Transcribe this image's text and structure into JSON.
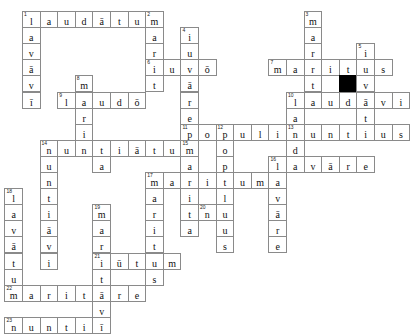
{
  "puzzle": {
    "title": "Latin Vocabulary Crossword",
    "kind": "crossword-grid",
    "cols": 23,
    "rows": 19,
    "cell_w": 17.6,
    "cell_h": 16.1,
    "origin_x": 22,
    "origin_y": 11,
    "colors": {
      "grid_line": "#8a8a8a",
      "block": "#000000",
      "letter": "#111111",
      "number": "#222222",
      "background": "#ffffff"
    },
    "entries": [
      {
        "number": 1,
        "direction": "across",
        "answer": "laudātum",
        "row": 0,
        "col": 0
      },
      {
        "number": 1,
        "direction": "down",
        "answer": "laudāvī",
        "row": 0,
        "col": 0
      },
      {
        "number": 2,
        "direction": "down",
        "answer": "maritiuvō",
        "row": 0,
        "col": 7
      },
      {
        "number": 3,
        "direction": "down",
        "answer": "maritum",
        "row": 0,
        "col": 16
      },
      {
        "number": 4,
        "direction": "down",
        "answer": "iuvāre",
        "row": 1,
        "col": 9
      },
      {
        "number": 5,
        "direction": "down",
        "answer": "iuvi",
        "row": 2,
        "col": 19
      },
      {
        "number": 6,
        "direction": "across",
        "answer": "iuvō",
        "row": 3,
        "col": 7
      },
      {
        "number": 7,
        "direction": "across",
        "answer": "maritus",
        "row": 3,
        "col": 14
      },
      {
        "number": 8,
        "direction": "down",
        "answer": "marin",
        "row": 4,
        "col": 3
      },
      {
        "number": 9,
        "direction": "across",
        "answer": "laudō",
        "row": 5,
        "col": 2
      },
      {
        "number": 10,
        "direction": "across",
        "answer": "laudāvi",
        "row": 5,
        "col": 15
      },
      {
        "number": 10,
        "direction": "down",
        "answer": "laudm",
        "row": 5,
        "col": 15
      },
      {
        "number": 11,
        "direction": "across",
        "answer": "populi",
        "row": 7,
        "col": 9
      },
      {
        "number": 12,
        "direction": "down",
        "answer": "populus",
        "row": 7,
        "col": 11
      },
      {
        "number": 13,
        "direction": "across",
        "answer": "nuntius",
        "row": 7,
        "col": 14
      },
      {
        "number": 14,
        "direction": "across",
        "answer": "nuntiātum",
        "row": 8,
        "col": 1
      },
      {
        "number": 14,
        "direction": "down",
        "answer": "nuntiāvi",
        "row": 8,
        "col": 1
      },
      {
        "number": 15,
        "direction": "down",
        "answer": "marita",
        "row": 8,
        "col": 9
      },
      {
        "number": 16,
        "direction": "across",
        "answer": "lavāre",
        "row": 9,
        "col": 14
      },
      {
        "number": 16,
        "direction": "down",
        "answer": "lav",
        "row": 9,
        "col": 14
      },
      {
        "number": 17,
        "direction": "across",
        "answer": "maritum",
        "row": 10,
        "col": 7
      },
      {
        "number": 17,
        "direction": "down",
        "answer": "marit",
        "row": 10,
        "col": 7
      },
      {
        "number": 18,
        "direction": "down",
        "answer": "lavātum",
        "row": 10,
        "col": -1
      },
      {
        "number": 19,
        "direction": "down",
        "answer": "maritvi",
        "row": 11,
        "col": 4
      },
      {
        "number": 20,
        "direction": "across",
        "answer": "nuntiō",
        "row": 12,
        "col": 10
      },
      {
        "number": 21,
        "direction": "across",
        "answer": "iūtum",
        "row": 13,
        "col": 4
      },
      {
        "number": 22,
        "direction": "across",
        "answer": "maritāre",
        "row": 16,
        "col": -1
      },
      {
        "number": 23,
        "direction": "across",
        "answer": "nuntiī",
        "row": 18,
        "col": -1
      }
    ],
    "cells": [
      {
        "c": 0,
        "r": 0,
        "l": "l",
        "n": "1"
      },
      {
        "c": 1,
        "r": 0,
        "l": "a"
      },
      {
        "c": 2,
        "r": 0,
        "l": "u"
      },
      {
        "c": 3,
        "r": 0,
        "l": "d"
      },
      {
        "c": 4,
        "r": 0,
        "l": "ā"
      },
      {
        "c": 5,
        "r": 0,
        "l": "t"
      },
      {
        "c": 6,
        "r": 0,
        "l": "u"
      },
      {
        "c": 7,
        "r": 0,
        "l": "m",
        "n": "2"
      },
      {
        "c": 16,
        "r": 0,
        "l": "m",
        "n": "3"
      },
      {
        "c": 0,
        "r": 1,
        "l": "a"
      },
      {
        "c": 7,
        "r": 1,
        "l": "a"
      },
      {
        "c": 9,
        "r": 1,
        "l": "i",
        "n": "4"
      },
      {
        "c": 16,
        "r": 1,
        "l": "a"
      },
      {
        "c": 0,
        "r": 2,
        "l": "v"
      },
      {
        "c": 7,
        "r": 2,
        "l": "r"
      },
      {
        "c": 9,
        "r": 2,
        "l": "u"
      },
      {
        "c": 16,
        "r": 2,
        "l": "r"
      },
      {
        "c": 19,
        "r": 2,
        "l": "i",
        "n": "5"
      },
      {
        "c": 0,
        "r": 3,
        "l": "ā"
      },
      {
        "c": 7,
        "r": 3,
        "l": "i",
        "n": "6"
      },
      {
        "c": 8,
        "r": 3,
        "l": "u"
      },
      {
        "c": 9,
        "r": 3,
        "l": "v"
      },
      {
        "c": 10,
        "r": 3,
        "l": "ō"
      },
      {
        "c": 14,
        "r": 3,
        "l": "m",
        "n": "7"
      },
      {
        "c": 15,
        "r": 3,
        "l": "a"
      },
      {
        "c": 16,
        "r": 3,
        "l": "r"
      },
      {
        "c": 17,
        "r": 3,
        "l": "i"
      },
      {
        "c": 18,
        "r": 3,
        "l": "t"
      },
      {
        "c": 19,
        "r": 3,
        "l": "u"
      },
      {
        "c": 20,
        "r": 3,
        "l": "s"
      },
      {
        "c": 0,
        "r": 4,
        "l": "v"
      },
      {
        "c": 3,
        "r": 4,
        "l": "m",
        "n": "8"
      },
      {
        "c": 7,
        "r": 4,
        "l": "t"
      },
      {
        "c": 9,
        "r": 4,
        "l": "ā"
      },
      {
        "c": 16,
        "r": 4,
        "l": "t"
      },
      {
        "c": 18,
        "r": 4,
        "l": "",
        "block": true
      },
      {
        "c": 19,
        "r": 4,
        "l": "v"
      },
      {
        "c": 0,
        "r": 5,
        "l": "ī"
      },
      {
        "c": 2,
        "r": 5,
        "l": "l",
        "n": "9"
      },
      {
        "c": 3,
        "r": 5,
        "l": "a"
      },
      {
        "c": 4,
        "r": 5,
        "l": "u"
      },
      {
        "c": 5,
        "r": 5,
        "l": "d"
      },
      {
        "c": 6,
        "r": 5,
        "l": "ō"
      },
      {
        "c": 9,
        "r": 5,
        "l": "r"
      },
      {
        "c": 15,
        "r": 5,
        "l": "l",
        "n": "10"
      },
      {
        "c": 16,
        "r": 5,
        "l": "a"
      },
      {
        "c": 17,
        "r": 5,
        "l": "u"
      },
      {
        "c": 18,
        "r": 5,
        "l": "d"
      },
      {
        "c": 19,
        "r": 5,
        "l": "ā"
      },
      {
        "c": 20,
        "r": 5,
        "l": "v"
      },
      {
        "c": 21,
        "r": 5,
        "l": "i"
      },
      {
        "c": 3,
        "r": 6,
        "l": "r"
      },
      {
        "c": 9,
        "r": 6,
        "l": "e"
      },
      {
        "c": 15,
        "r": 6,
        "l": "a"
      },
      {
        "c": 19,
        "r": 6,
        "l": "t"
      },
      {
        "c": 3,
        "r": 7,
        "l": "i"
      },
      {
        "c": 9,
        "r": 7,
        "l": "p",
        "n": "11"
      },
      {
        "c": 10,
        "r": 7,
        "l": "o"
      },
      {
        "c": 11,
        "r": 7,
        "l": "p",
        "n": "12"
      },
      {
        "c": 12,
        "r": 7,
        "l": "u"
      },
      {
        "c": 13,
        "r": 7,
        "l": "l"
      },
      {
        "c": 14,
        "r": 7,
        "l": "i"
      },
      {
        "c": 15,
        "r": 7,
        "l": "n",
        "n": "13"
      },
      {
        "c": 16,
        "r": 7,
        "l": "u"
      },
      {
        "c": 17,
        "r": 7,
        "l": "n"
      },
      {
        "c": 18,
        "r": 7,
        "l": "t"
      },
      {
        "c": 19,
        "r": 7,
        "l": "i"
      },
      {
        "c": 20,
        "r": 7,
        "l": "u"
      },
      {
        "c": 21,
        "r": 7,
        "l": "s"
      },
      {
        "c": 1,
        "r": 8,
        "l": "n",
        "n": "14"
      },
      {
        "c": 2,
        "r": 8,
        "l": "u"
      },
      {
        "c": 3,
        "r": 8,
        "l": "n"
      },
      {
        "c": 4,
        "r": 8,
        "l": "t"
      },
      {
        "c": 5,
        "r": 8,
        "l": "i"
      },
      {
        "c": 6,
        "r": 8,
        "l": "ā"
      },
      {
        "c": 7,
        "r": 8,
        "l": "t"
      },
      {
        "c": 8,
        "r": 8,
        "l": "u"
      },
      {
        "c": 9,
        "r": 8,
        "l": "m",
        "n": "15"
      },
      {
        "c": 11,
        "r": 8,
        "l": "o"
      },
      {
        "c": 15,
        "r": 8,
        "l": "d"
      },
      {
        "c": 1,
        "r": 9,
        "l": "u"
      },
      {
        "c": 4,
        "r": 9,
        "l": "a"
      },
      {
        "c": 9,
        "r": 9,
        "l": "a"
      },
      {
        "c": 11,
        "r": 9,
        "l": "p"
      },
      {
        "c": 14,
        "r": 9,
        "l": "l",
        "n": "16"
      },
      {
        "c": 15,
        "r": 9,
        "l": "a"
      },
      {
        "c": 16,
        "r": 9,
        "l": "v"
      },
      {
        "c": 17,
        "r": 9,
        "l": "ā"
      },
      {
        "c": 18,
        "r": 9,
        "l": "r"
      },
      {
        "c": 19,
        "r": 9,
        "l": "e"
      },
      {
        "c": 1,
        "r": 10,
        "l": "n"
      },
      {
        "c": 7,
        "r": 10,
        "l": "m",
        "n": "17"
      },
      {
        "c": 8,
        "r": 10,
        "l": "a"
      },
      {
        "c": 9,
        "r": 10,
        "l": "r"
      },
      {
        "c": 10,
        "r": 10,
        "l": "i"
      },
      {
        "c": 11,
        "r": 10,
        "l": "t"
      },
      {
        "c": 12,
        "r": 10,
        "l": "u"
      },
      {
        "c": 13,
        "r": 10,
        "l": "m"
      },
      {
        "c": 14,
        "r": 10,
        "l": "a"
      },
      {
        "c": -1,
        "r": 11,
        "l": "l",
        "n": "18"
      },
      {
        "c": 1,
        "r": 11,
        "l": "t"
      },
      {
        "c": 7,
        "r": 11,
        "l": "a"
      },
      {
        "c": 9,
        "r": 11,
        "l": "i"
      },
      {
        "c": 11,
        "r": 11,
        "l": "l"
      },
      {
        "c": 14,
        "r": 11,
        "l": "v"
      },
      {
        "c": -1,
        "r": 12,
        "l": "a"
      },
      {
        "c": 1,
        "r": 12,
        "l": "i"
      },
      {
        "c": 4,
        "r": 12,
        "l": "m",
        "n": "19"
      },
      {
        "c": 7,
        "r": 12,
        "l": "r"
      },
      {
        "c": 9,
        "r": 12,
        "l": "t"
      },
      {
        "c": 10,
        "r": 12,
        "l": "n",
        "n": "20"
      },
      {
        "c": 11,
        "r": 12,
        "l": "u"
      },
      {
        "c": 14,
        "r": 12,
        "l": "ā"
      },
      {
        "c": -1,
        "r": 13,
        "l": "v"
      },
      {
        "c": 1,
        "r": 13,
        "l": "ā"
      },
      {
        "c": 4,
        "r": 13,
        "l": "a"
      },
      {
        "c": 7,
        "r": 13,
        "l": "i"
      },
      {
        "c": 9,
        "r": 13,
        "l": "a"
      },
      {
        "c": 11,
        "r": 13,
        "l": "u"
      },
      {
        "c": 14,
        "r": 13,
        "l": "r"
      },
      {
        "c": -1,
        "r": 14,
        "l": "ā"
      },
      {
        "c": 1,
        "r": 14,
        "l": "v"
      },
      {
        "c": 4,
        "r": 14,
        "l": "r"
      },
      {
        "c": 7,
        "r": 14,
        "l": "t"
      },
      {
        "c": 11,
        "r": 14,
        "l": "s"
      },
      {
        "c": 14,
        "r": 14,
        "l": "e"
      },
      {
        "c": -1,
        "r": 15,
        "l": "t"
      },
      {
        "c": 1,
        "r": 15,
        "l": "i"
      },
      {
        "c": 4,
        "r": 15,
        "l": "i",
        "n": "21"
      },
      {
        "c": 5,
        "r": 15,
        "l": "ū"
      },
      {
        "c": 6,
        "r": 15,
        "l": "t"
      },
      {
        "c": 7,
        "r": 15,
        "l": "u"
      },
      {
        "c": 8,
        "r": 15,
        "l": "m"
      },
      {
        "c": -1,
        "r": 16,
        "l": "u"
      },
      {
        "c": 4,
        "r": 16,
        "l": "t"
      },
      {
        "c": 7,
        "r": 16,
        "l": "s"
      },
      {
        "c": -1,
        "r": 17,
        "l": "m",
        "n": "22"
      },
      {
        "c": 0,
        "r": 17,
        "l": "a"
      },
      {
        "c": 1,
        "r": 17,
        "l": "r"
      },
      {
        "c": 2,
        "r": 17,
        "l": "i"
      },
      {
        "c": 3,
        "r": 17,
        "l": "t"
      },
      {
        "c": 4,
        "r": 17,
        "l": "ā"
      },
      {
        "c": 5,
        "r": 17,
        "l": "r"
      },
      {
        "c": 6,
        "r": 17,
        "l": "e"
      },
      {
        "c": 4,
        "r": 18,
        "l": "v"
      },
      {
        "c": -1,
        "r": 19,
        "l": "n",
        "n": "23"
      },
      {
        "c": 0,
        "r": 19,
        "l": "u"
      },
      {
        "c": 1,
        "r": 19,
        "l": "n"
      },
      {
        "c": 2,
        "r": 19,
        "l": "t"
      },
      {
        "c": 3,
        "r": 19,
        "l": "i"
      },
      {
        "c": 4,
        "r": 19,
        "l": "ī"
      }
    ]
  }
}
